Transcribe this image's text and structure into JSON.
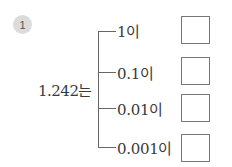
{
  "problem": {
    "number": "1",
    "lead_text": "1.242는",
    "branches": [
      {
        "label": "1이",
        "answer": ""
      },
      {
        "label": "0.1이",
        "answer": ""
      },
      {
        "label": "0.01이",
        "answer": ""
      },
      {
        "label": "0.001이",
        "answer": ""
      }
    ]
  }
}
